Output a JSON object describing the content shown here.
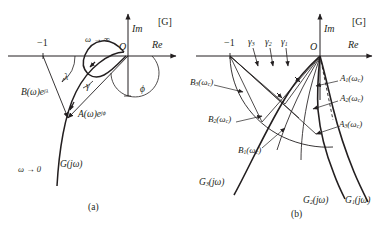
{
  "figure": {
    "plane_tag": "[G]",
    "axis_im": "Im",
    "axis_re": "Re",
    "origin": "O",
    "critical_point": "−1"
  },
  "panel_a": {
    "caption": "(a)",
    "plane_tag": "[G]",
    "axis_im": "Im",
    "axis_re": "Re",
    "origin": "O",
    "critical_point": "−1",
    "omega_inf": "ω → ∞",
    "omega_zero": "ω → 0",
    "curve_label": "G(jω)",
    "vector_a": "A(ω)e",
    "vector_a_exp": "jϕ",
    "vector_b": "B(ω)e",
    "vector_b_exp": "jλ",
    "angle_lambda": "λ",
    "angle_gamma": "γ",
    "angle_phi": "ϕ"
  },
  "panel_b": {
    "caption": "(b)",
    "plane_tag": "[G]",
    "axis_im": "Im",
    "axis_re": "Re",
    "origin": "O",
    "critical_point": "−1",
    "gamma_labels": [
      {
        "base": "γ",
        "sub": "3"
      },
      {
        "base": "γ",
        "sub": "2"
      },
      {
        "base": "γ",
        "sub": "1"
      }
    ],
    "a_labels": [
      {
        "base": "A",
        "sub": "1",
        "arg": "(ω",
        "argsub": "c",
        "close": ")"
      },
      {
        "base": "A",
        "sub": "2",
        "arg": "(ω",
        "argsub": "c",
        "close": ")"
      },
      {
        "base": "A",
        "sub": "3",
        "arg": "(ω",
        "argsub": "c",
        "close": ")"
      }
    ],
    "b_labels": [
      {
        "base": "B",
        "sub": "3",
        "arg": "(ω",
        "argsub": "c",
        "close": ")"
      },
      {
        "base": "B",
        "sub": "2",
        "arg": "(ω",
        "argsub": "c",
        "close": ")"
      },
      {
        "base": "B",
        "sub": "1",
        "arg": "(ω",
        "argsub": "c",
        "close": ")"
      }
    ],
    "g_labels": [
      {
        "base": "G",
        "sub": "3",
        "arg": "(jω)"
      },
      {
        "base": "G",
        "sub": "2",
        "arg": "(jω)"
      },
      {
        "base": "G",
        "sub": "1",
        "arg": "(jω)"
      }
    ]
  }
}
